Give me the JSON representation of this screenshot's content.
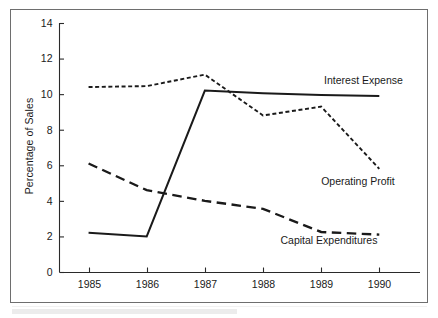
{
  "chart_data": {
    "type": "line",
    "title": "",
    "subtitle": "",
    "xlabel": "",
    "ylabel": "Percentage of Sales",
    "categories": [
      "1985",
      "1986",
      "1987",
      "1988",
      "1989",
      "1990"
    ],
    "x": [
      1985,
      1986,
      1987,
      1988,
      1989,
      1990
    ],
    "xlim": [
      1984.5,
      1990.7
    ],
    "ylim": [
      0,
      14
    ],
    "yticks": [
      0,
      2,
      4,
      6,
      8,
      10,
      12,
      14
    ],
    "ytick_labels": [
      "0",
      "2",
      "4",
      "6",
      "8",
      "10",
      "12",
      "14"
    ],
    "xticks": [
      1985,
      1986,
      1987,
      1988,
      1989,
      1990
    ],
    "xtick_labels": [
      "1985",
      "1986",
      "1987",
      "1988",
      "1989",
      "1990"
    ],
    "grid": false,
    "legend_position": "inline-right",
    "series": [
      {
        "name": "Interest Expense",
        "style": "solid",
        "color": "#1a1a1a",
        "values": [
          2.2,
          2.0,
          10.2,
          10.05,
          9.95,
          9.9
        ]
      },
      {
        "name": "Operating Profit",
        "style": "dotted",
        "color": "#1a1a1a",
        "values": [
          10.4,
          10.45,
          11.1,
          8.8,
          9.3,
          5.8
        ]
      },
      {
        "name": "Capital Expenditures",
        "style": "dashed",
        "color": "#1a1a1a",
        "values": [
          6.1,
          4.6,
          4.0,
          3.55,
          2.25,
          2.1
        ]
      }
    ],
    "annotations": [
      {
        "text": "Interest Expense",
        "x": 1989.05,
        "y": 10.55,
        "anchor": "start"
      },
      {
        "text": "Operating Profit",
        "x": 1989.0,
        "y": 4.9,
        "anchor": "start"
      },
      {
        "text": "Capital Expenditures",
        "x": 1988.3,
        "y": 1.55,
        "anchor": "start"
      }
    ]
  },
  "figure": {
    "ylabel": "Percentage of Sales",
    "frame_color": "#6e6e6e",
    "ink_color": "#1a1a1a",
    "background": "#ffffff"
  }
}
